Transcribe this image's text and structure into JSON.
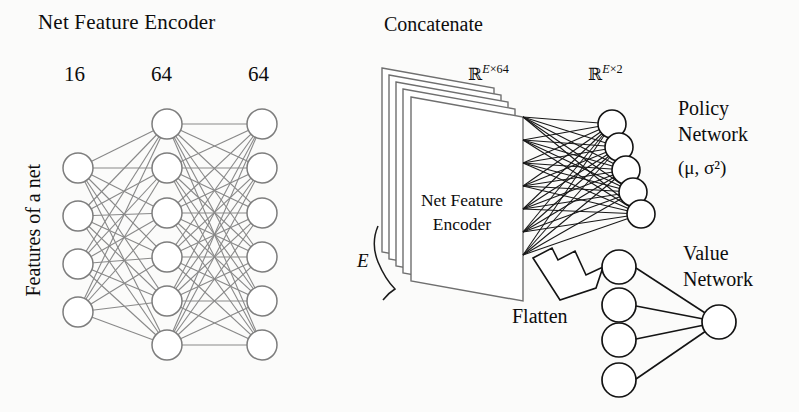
{
  "diagram": {
    "type": "neural-network-architecture",
    "background_color": "#fbfbfa",
    "left_panel": {
      "title": "Net Feature Encoder",
      "input_axis_label": "Features of a net",
      "layer_sizes": [
        "16",
        "64",
        "64"
      ],
      "drawn_nodes_per_layer": [
        4,
        6,
        6
      ],
      "stroke_color": "#7d7d7d"
    },
    "middle_panel": {
      "concatenate_label": "Concatenate",
      "stack_card_label_line1": "Net Feature",
      "stack_card_label_line2": "Encoder",
      "stack_count_label": "E",
      "stack_cards": 5,
      "output_dim_label": "ℝE×64",
      "flatten_label": "Flatten",
      "stroke_color": "#6f6f6f"
    },
    "right_panel": {
      "policy_dim_label": "ℝE×2",
      "policy_title_line1": "Policy",
      "policy_title_line2": "Network",
      "policy_params": "(μ, σ²)",
      "policy_nodes": 5,
      "value_title_line1": "Value",
      "value_title_line2": "Network",
      "value_input_nodes": 4,
      "value_output_nodes": 1,
      "stroke_color": "#111111"
    }
  }
}
